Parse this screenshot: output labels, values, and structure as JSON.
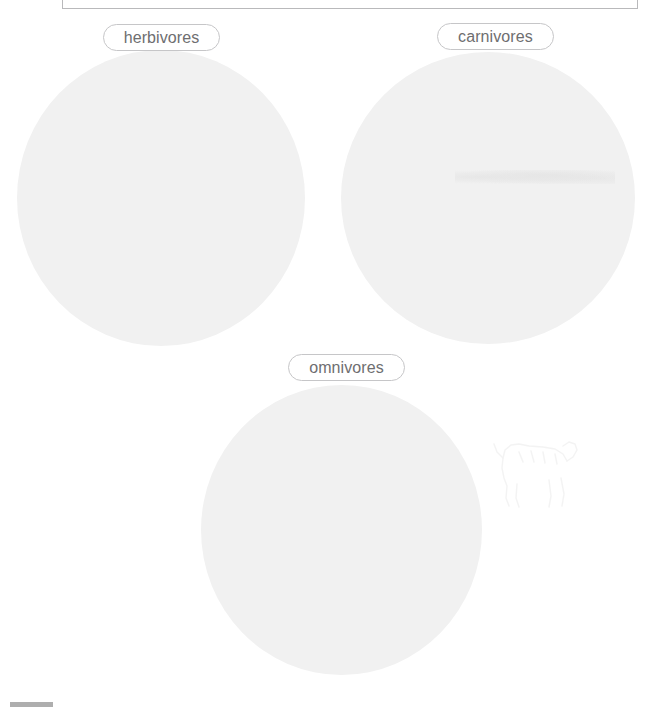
{
  "worksheet": {
    "frame": {
      "name": "instruction-box",
      "border_color": "#b9b9bb"
    },
    "zones": [
      {
        "id": "herbivores",
        "label": "herbivores",
        "shape": "circle",
        "fill_color": "#f1f1f1"
      },
      {
        "id": "carnivores",
        "label": "carnivores",
        "shape": "circle",
        "fill_color": "#f1f1f1"
      },
      {
        "id": "omnivores",
        "label": "omnivores",
        "shape": "circle",
        "fill_color": "#f1f1f1"
      }
    ],
    "label_style": {
      "text_color": "#6e6e70",
      "border_color": "#c6c6c8",
      "background_color": "#ffffff"
    },
    "footer_mark": {
      "name": "page-footer-mark",
      "color": "#aeaeae"
    },
    "background_color": "#ffffff"
  }
}
